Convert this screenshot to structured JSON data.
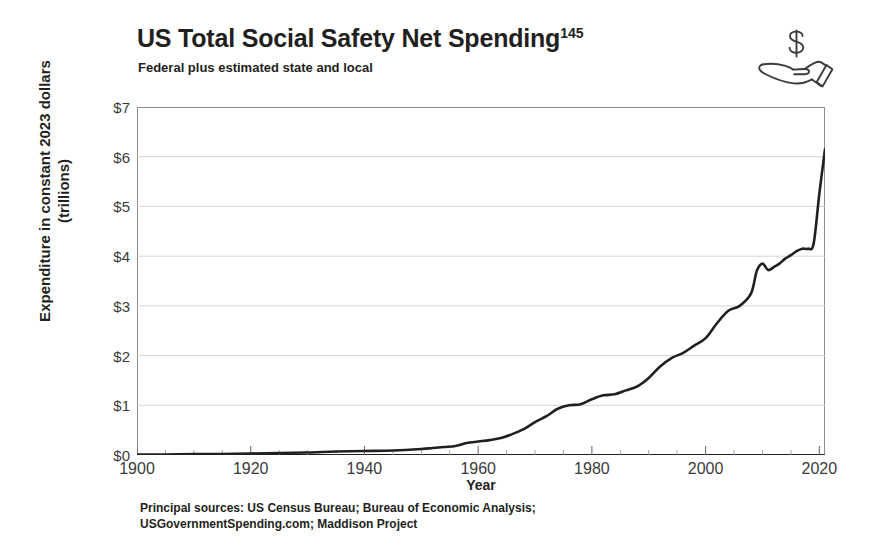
{
  "header": {
    "title": "US Total Social Safety Net Spending",
    "title_superscript": "145",
    "subtitle": "Federal plus estimated state and local",
    "icon": "hand-holding-dollar-icon"
  },
  "source_note": "Principal sources: US Census Bureau; Bureau of Economic Analysis;\nUSGovernmentSpending.com; Maddison Project",
  "colors": {
    "line": "#231f20",
    "grid": "#d4d4d4",
    "frame": "#8c8c8c",
    "axis": "#231f20",
    "text": "#231f20",
    "tick_text": "#3b3b3b",
    "background": "#ffffff"
  },
  "chart_data": {
    "type": "line",
    "title": "US Total Social Safety Net Spending",
    "subtitle": "Federal plus estimated state and local",
    "xlabel": "Year",
    "ylabel": "Expenditure in constant 2023 dollars (trillions)",
    "xlim": [
      1900,
      2021
    ],
    "ylim": [
      0,
      7
    ],
    "xticks": [
      1900,
      1920,
      1940,
      1960,
      1980,
      2000,
      2020
    ],
    "xtick_labels": [
      "1900",
      "1920",
      "1940",
      "1960",
      "1980",
      "2000",
      "2020"
    ],
    "x_minor_tick_interval": 5,
    "yticks": [
      0,
      1,
      2,
      3,
      4,
      5,
      6,
      7
    ],
    "ytick_labels": [
      "$0",
      "$1",
      "$2",
      "$3",
      "$4",
      "$5",
      "$6",
      "$7"
    ],
    "grid": "horizontal",
    "legend": "none",
    "series": [
      {
        "name": "US Total Social Safety Net Spending",
        "units": "trillions of constant 2023 dollars",
        "x": [
          1900,
          1905,
          1910,
          1915,
          1920,
          1925,
          1930,
          1935,
          1940,
          1945,
          1950,
          1952,
          1954,
          1956,
          1958,
          1960,
          1962,
          1964,
          1966,
          1968,
          1970,
          1972,
          1974,
          1976,
          1978,
          1980,
          1982,
          1984,
          1986,
          1988,
          1990,
          1992,
          1994,
          1996,
          1998,
          2000,
          2002,
          2004,
          2006,
          2008,
          2009,
          2010,
          2011,
          2012,
          2013,
          2014,
          2015,
          2016,
          2017,
          2018,
          2019,
          2020,
          2021
        ],
        "y": [
          0.01,
          0.01,
          0.02,
          0.02,
          0.03,
          0.04,
          0.05,
          0.07,
          0.08,
          0.09,
          0.12,
          0.14,
          0.16,
          0.18,
          0.24,
          0.27,
          0.3,
          0.34,
          0.42,
          0.52,
          0.66,
          0.78,
          0.93,
          1.0,
          1.02,
          1.12,
          1.2,
          1.22,
          1.3,
          1.38,
          1.55,
          1.78,
          1.95,
          2.05,
          2.2,
          2.35,
          2.65,
          2.9,
          3.0,
          3.25,
          3.7,
          3.85,
          3.72,
          3.78,
          3.85,
          3.95,
          4.02,
          4.1,
          4.15,
          4.15,
          4.25,
          5.25,
          6.15
        ]
      }
    ],
    "annotations": [
      {
        "label": "flat near zero through mid-century",
        "x_range": [
          1900,
          1950
        ]
      },
      {
        "label": "2009-2010 recession bump",
        "x_range": [
          2008,
          2011
        ],
        "peak_value": 3.85
      },
      {
        "label": "2020-2021 pandemic spike",
        "x_range": [
          2019,
          2021
        ],
        "peak_value": 6.15
      }
    ]
  }
}
